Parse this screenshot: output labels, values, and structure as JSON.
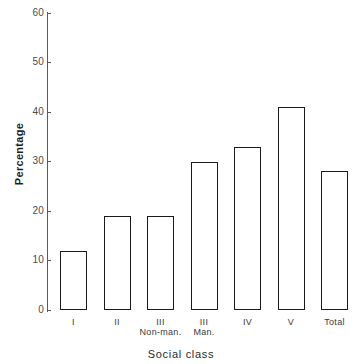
{
  "chart_data": {
    "type": "bar",
    "title": "",
    "xlabel": "Social class",
    "ylabel": "Percentage",
    "categories": [
      "I",
      "II",
      "III\nNon-man.",
      "III\nMan.",
      "IV",
      "V",
      "Total"
    ],
    "values": [
      12,
      19,
      19,
      30,
      33,
      41,
      28
    ],
    "ylim": [
      0,
      60
    ],
    "yticks": [
      0,
      10,
      20,
      30,
      40,
      50,
      60
    ],
    "ytick_labels": [
      "0",
      "10",
      "20",
      "30",
      "40",
      "50",
      "60"
    ],
    "grid": false,
    "legend": null,
    "bar_color": "#ffffff",
    "bar_edge_color": "#1a1a1a",
    "axis_color": "#5a5a5a"
  }
}
